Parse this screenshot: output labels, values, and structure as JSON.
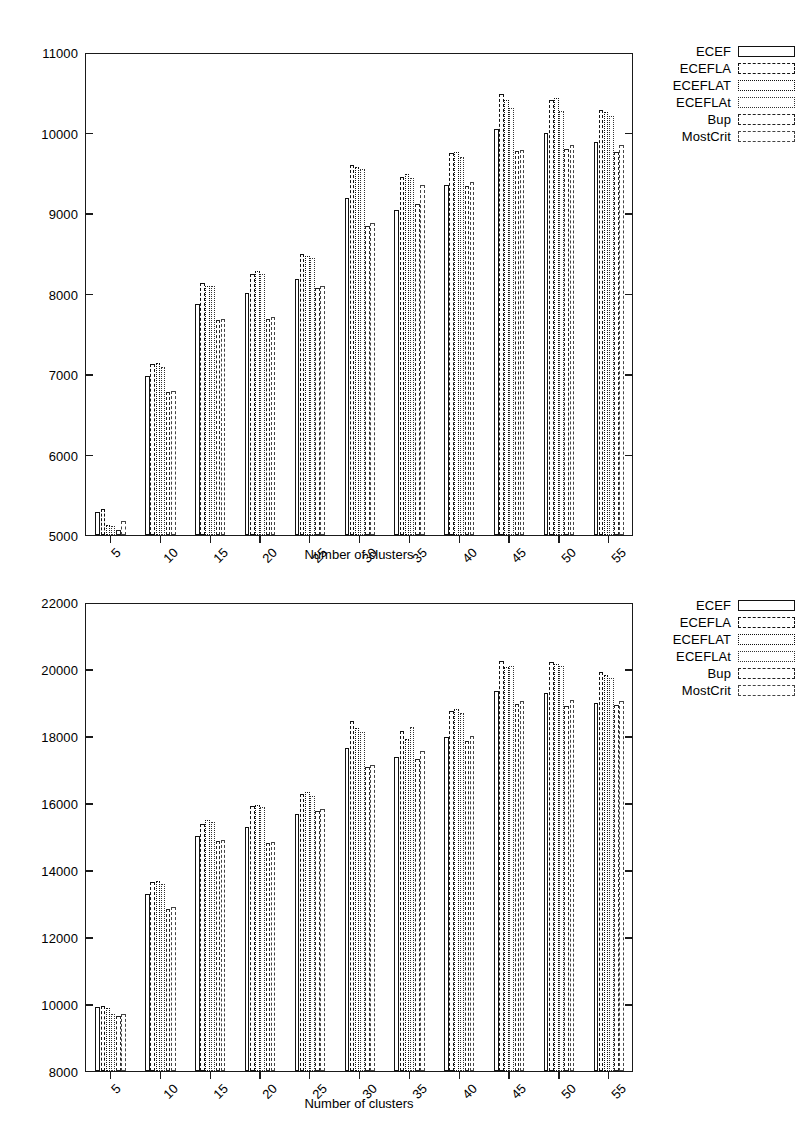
{
  "chart_data": [
    {
      "id": "top",
      "type": "bar",
      "title": "",
      "xlabel": "Number of clusters",
      "ylabel": "",
      "categories": [
        5,
        10,
        15,
        20,
        25,
        30,
        35,
        40,
        45,
        50,
        55
      ],
      "xtick_labels": [
        "5",
        "10",
        "15",
        "20",
        "25",
        "30",
        "35",
        "40",
        "45",
        "50",
        "55"
      ],
      "ytick_labels": [
        "5000",
        "6000",
        "7000",
        "8000",
        "9000",
        "10000",
        "11000"
      ],
      "yticks": [
        5000,
        6000,
        7000,
        8000,
        9000,
        10000,
        11000
      ],
      "ylim": [
        5000,
        11000
      ],
      "grid": false,
      "legend_position": "outside-top-right",
      "series": [
        {
          "name": "ECEF",
          "values": [
            5290,
            6980,
            7880,
            8020,
            8190,
            9210,
            9050,
            9360,
            10060,
            10020,
            9900
          ]
        },
        {
          "name": "ECEFLA",
          "values": [
            5320,
            7130,
            8140,
            8250,
            8510,
            9620,
            9470,
            9760,
            10500,
            10430,
            10300
          ]
        },
        {
          "name": "ECEFLAT",
          "values": [
            5120,
            7140,
            8110,
            8290,
            8480,
            9590,
            9500,
            9780,
            10430,
            10450,
            10280
          ]
        },
        {
          "name": "ECEFLAt",
          "values": [
            5110,
            7100,
            8100,
            8260,
            8450,
            9560,
            9450,
            9720,
            10330,
            10290,
            10230
          ]
        },
        {
          "name": "Bup",
          "values": [
            5060,
            6780,
            7680,
            7700,
            8080,
            8850,
            9130,
            9350,
            9790,
            9820,
            9780
          ]
        },
        {
          "name": "MostCrit",
          "values": [
            5170,
            6800,
            7700,
            7720,
            8110,
            8890,
            9370,
            9400,
            9800,
            9860,
            9860
          ]
        }
      ]
    },
    {
      "id": "bottom",
      "type": "bar",
      "title": "",
      "xlabel": "Number of clusters",
      "ylabel": "",
      "categories": [
        5,
        10,
        15,
        20,
        25,
        30,
        35,
        40,
        45,
        50,
        55
      ],
      "xtick_labels": [
        "5",
        "10",
        "15",
        "20",
        "25",
        "30",
        "35",
        "40",
        "45",
        "50",
        "55"
      ],
      "ytick_labels": [
        "8000",
        "10000",
        "12000",
        "14000",
        "16000",
        "18000",
        "20000",
        "22000"
      ],
      "yticks": [
        8000,
        10000,
        12000,
        14000,
        16000,
        18000,
        20000,
        22000
      ],
      "ylim": [
        8000,
        22000
      ],
      "grid": false,
      "legend_position": "outside-top-right",
      "series": [
        {
          "name": "ECEF",
          "values": [
            9930,
            13300,
            15060,
            15320,
            15700,
            17680,
            17400,
            18000,
            19380,
            19330,
            19020
          ]
        },
        {
          "name": "ECEFLA",
          "values": [
            9950,
            13680,
            15420,
            15950,
            16300,
            18500,
            18200,
            18800,
            20300,
            20250,
            19950
          ]
        },
        {
          "name": "ECEFLAT",
          "values": [
            9880,
            13700,
            15520,
            15980,
            16350,
            18280,
            17950,
            18850,
            20100,
            20200,
            19880
          ]
        },
        {
          "name": "ECEFLAt",
          "values": [
            9700,
            13620,
            15480,
            15900,
            16250,
            18150,
            18300,
            18720,
            20130,
            20130,
            19780
          ]
        },
        {
          "name": "Bup",
          "values": [
            9640,
            12850,
            14900,
            14850,
            15800,
            17100,
            17350,
            17900,
            19000,
            18950,
            18980
          ]
        },
        {
          "name": "MostCrit",
          "values": [
            9720,
            12920,
            14940,
            14880,
            15850,
            17180,
            17600,
            18050,
            19100,
            19120,
            19080
          ]
        }
      ]
    }
  ],
  "legend": {
    "items": [
      {
        "label": "ECEF"
      },
      {
        "label": "ECEFLA"
      },
      {
        "label": "ECEFLAT"
      },
      {
        "label": "ECEFLAt"
      },
      {
        "label": "Bup"
      },
      {
        "label": "MostCrit"
      }
    ]
  },
  "colors": {
    "axis": "#1a1a1a",
    "bar_outline": "#111111",
    "background": "#ffffff"
  }
}
